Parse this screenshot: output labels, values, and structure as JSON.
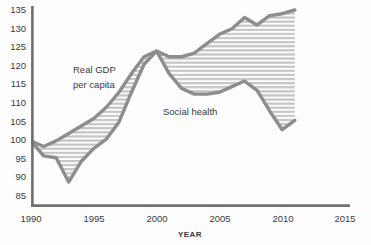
{
  "chart_data": {
    "type": "area",
    "title": "",
    "subtitle": "",
    "xlabel": "YEAR",
    "ylabel": "",
    "xlim": [
      1990,
      2015
    ],
    "ylim": [
      85,
      135
    ],
    "grid": false,
    "legend_position": "inline-annotations",
    "xticks": [
      1990,
      1995,
      2000,
      2005,
      2010,
      2015
    ],
    "yticks": [
      85,
      90,
      95,
      100,
      105,
      110,
      115,
      120,
      125,
      130,
      135
    ],
    "annotations": [
      {
        "text": "Real GDP per capita",
        "x": 1993.5,
        "y": 117
      },
      {
        "text": "Social health",
        "x": 2000.5,
        "y": 108
      }
    ],
    "fill_between": {
      "label": "Gap between Real GDP per capita and Social health",
      "pattern": "horizontal-stripes",
      "color": "#c9c9c9"
    },
    "x": [
      1990,
      1991,
      1992,
      1993,
      1994,
      1995,
      1996,
      1997,
      1998,
      1999,
      2000,
      2001,
      2002,
      2003,
      2004,
      2005,
      2006,
      2007,
      2008,
      2009,
      2010,
      2011
    ],
    "series": [
      {
        "name": "Real GDP per capita",
        "color": "#8d8d8d",
        "values": [
          100,
          98.5,
          100,
          102,
          104,
          106,
          109,
          113,
          118,
          122.5,
          124,
          122.5,
          122.5,
          123.5,
          126,
          128.5,
          130,
          133,
          131,
          133.5,
          134,
          135
        ]
      },
      {
        "name": "Social health",
        "color": "#8d8d8d",
        "values": [
          100,
          96,
          95.5,
          89,
          94.5,
          98,
          100.5,
          105,
          113,
          120.5,
          124,
          118,
          114,
          112.5,
          112.5,
          113,
          114.5,
          116,
          113.5,
          108,
          103,
          105.5
        ]
      }
    ]
  },
  "axis": {
    "x_title": "YEAR",
    "x_tick_labels": [
      "1990",
      "1995",
      "2000",
      "2005",
      "2010",
      "2015"
    ],
    "y_tick_labels": [
      "135",
      "130",
      "125",
      "120",
      "115",
      "110",
      "105",
      "100",
      "95",
      "90",
      "85"
    ]
  },
  "labels": {
    "gdp_line1": "Real GDP",
    "gdp_line2": "per capita",
    "social_health": "Social health"
  },
  "colors": {
    "line": "#8d8d8d",
    "axis": "#6f6f6f",
    "fill": "#c9c9c9",
    "text": "#3a3a3a",
    "background": "#fdfdfd"
  }
}
